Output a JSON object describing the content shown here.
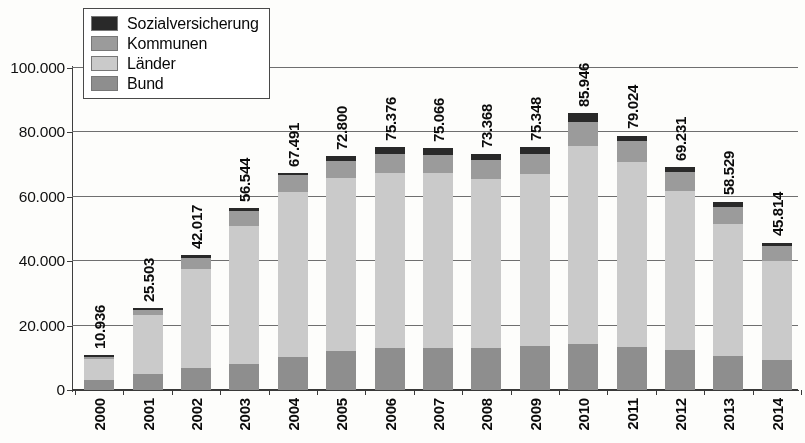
{
  "chart_data": {
    "type": "bar",
    "subtype": "stacked-bar",
    "title": "",
    "xlabel": "",
    "ylabel": "",
    "ylim": [
      0,
      100000
    ],
    "ytick_labels": [
      "0",
      "20.000",
      "40.000",
      "60.000",
      "80.000",
      "100.000"
    ],
    "ytick_values": [
      0,
      20000,
      40000,
      60000,
      80000,
      100000
    ],
    "grid": true,
    "legend_position": "top-left",
    "categories": [
      "2000",
      "2001",
      "2002",
      "2003",
      "2004",
      "2005",
      "2006",
      "2007",
      "2008",
      "2009",
      "2010",
      "2011",
      "2012",
      "2013",
      "2014"
    ],
    "series": [
      {
        "name": "Bund",
        "color": "#8e8e8e",
        "values": [
          3200,
          5100,
          6900,
          8200,
          10300,
          12100,
          12900,
          13200,
          13100,
          13700,
          14300,
          13400,
          12400,
          10700,
          9200
        ]
      },
      {
        "name": "Länder",
        "color": "#c9c9c9",
        "values": [
          6300,
          18100,
          30800,
          42700,
          51300,
          53900,
          54600,
          54100,
          52400,
          53400,
          61400,
          57300,
          49500,
          40900,
          30900
        ]
      },
      {
        "name": "Kommunen",
        "color": "#9a9a9a",
        "values": [
          900,
          1700,
          3400,
          4600,
          5100,
          5100,
          5900,
          5800,
          6000,
          6300,
          7600,
          6700,
          5700,
          5200,
          4700
        ]
      },
      {
        "name": "Sozialversicherung",
        "color": "#2b2b2b",
        "values": [
          536,
          603,
          917,
          1044,
          791,
          1700,
          1976,
          1966,
          1868,
          1948,
          2646,
          1624,
          1631,
          1729,
          1014
        ]
      }
    ],
    "totals": [
      10936,
      25503,
      42017,
      56544,
      67491,
      72800,
      75376,
      75066,
      73368,
      75348,
      85946,
      79024,
      69231,
      58529,
      45814
    ],
    "total_labels": [
      "10.936",
      "25.503",
      "42.017",
      "56.544",
      "67.491",
      "72.800",
      "75.376",
      "75.066",
      "73.368",
      "75.348",
      "85.946",
      "79.024",
      "69.231",
      "58.529",
      "45.814"
    ]
  },
  "legend": {
    "items": [
      {
        "label": "Sozialversicherung",
        "color": "#2b2b2b"
      },
      {
        "label": "Kommunen",
        "color": "#9a9a9a"
      },
      {
        "label": "Länder",
        "color": "#c9c9c9"
      },
      {
        "label": "Bund",
        "color": "#8e8e8e"
      }
    ]
  }
}
